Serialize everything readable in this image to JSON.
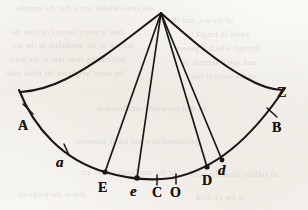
{
  "figure": {
    "kind": "geometric-line-diagram",
    "width": 308,
    "height": 210,
    "ink_color": "#1a1714",
    "paper_color": "#f7f5f1"
  },
  "geometry": {
    "apex": {
      "x": 161,
      "y": 13
    },
    "main_arc": {
      "label": "main-arc",
      "left_end": {
        "x": 19,
        "y": 90
      },
      "right_end": {
        "x": 285,
        "y": 88
      },
      "lowest": {
        "x": 150,
        "y": 180
      }
    },
    "upper_curve_left": {
      "label": "upper-curve-left-branch",
      "from": {
        "x": 161,
        "y": 13
      },
      "to": {
        "x": 21,
        "y": 92
      }
    },
    "upper_curve_right": {
      "label": "upper-curve-right-branch",
      "from": {
        "x": 161,
        "y": 13
      },
      "to": {
        "x": 283,
        "y": 90
      }
    },
    "chords": [
      {
        "name": "chord-apex-to-E",
        "from": {
          "x": 161,
          "y": 13
        },
        "to": {
          "x": 105,
          "y": 172
        }
      },
      {
        "name": "chord-apex-to-e",
        "from": {
          "x": 161,
          "y": 13
        },
        "to": {
          "x": 137,
          "y": 178
        }
      },
      {
        "name": "chord-apex-to-D",
        "from": {
          "x": 161,
          "y": 13
        },
        "to": {
          "x": 207,
          "y": 167
        }
      },
      {
        "name": "chord-apex-to-d",
        "from": {
          "x": 161,
          "y": 13
        },
        "to": {
          "x": 222,
          "y": 160
        }
      }
    ]
  },
  "points": [
    {
      "id": "A",
      "label": "A",
      "style": "capital",
      "marker": "tick",
      "marker_x": 28,
      "marker_y": 110,
      "label_x": 18,
      "label_y": 119
    },
    {
      "id": "a",
      "label": "a",
      "style": "italic",
      "marker": "tick",
      "marker_x": 66,
      "marker_y": 150,
      "label_x": 56,
      "label_y": 155
    },
    {
      "id": "E",
      "label": "E",
      "style": "capital",
      "marker": "node",
      "marker_x": 105,
      "marker_y": 172,
      "label_x": 98,
      "label_y": 181
    },
    {
      "id": "e",
      "label": "e",
      "style": "italic",
      "marker": "node",
      "marker_x": 137,
      "marker_y": 178,
      "label_x": 130,
      "label_y": 184
    },
    {
      "id": "C",
      "label": "C",
      "style": "capital",
      "marker": "tick",
      "marker_x": 157,
      "marker_y": 180,
      "label_x": 152,
      "label_y": 186
    },
    {
      "id": "O",
      "label": "O",
      "style": "capital",
      "marker": "tick",
      "marker_x": 176,
      "marker_y": 179,
      "label_x": 170,
      "label_y": 186
    },
    {
      "id": "D",
      "label": "D",
      "style": "capital",
      "marker": "node",
      "marker_x": 207,
      "marker_y": 167,
      "label_x": 202,
      "label_y": 174
    },
    {
      "id": "d",
      "label": "d",
      "style": "italic",
      "marker": "node",
      "marker_x": 222,
      "marker_y": 160,
      "label_x": 218,
      "label_y": 163
    },
    {
      "id": "B",
      "label": "B",
      "style": "capital",
      "marker": "tick",
      "marker_x": 272,
      "marker_y": 113,
      "label_x": 272,
      "label_y": 121
    },
    {
      "id": "Z",
      "label": "Z",
      "style": "capital",
      "marker": "none",
      "marker_x": 283,
      "marker_y": 90,
      "label_x": 277,
      "label_y": 86
    }
  ],
  "bleed_text": {
    "note": "faint mirrored show-through text from the reverse page",
    "lines": [
      {
        "text": "the considerable force that the impulse",
        "x": 14,
        "y": 4,
        "size": 8
      },
      {
        "text": "of the arc, and the time",
        "x": 150,
        "y": 16,
        "size": 8
      },
      {
        "text": "that in every second of time the",
        "x": 10,
        "y": 28,
        "size": 8
      },
      {
        "text": "equal in length to",
        "x": 186,
        "y": 30,
        "size": 8
      },
      {
        "text": "motion of the pendulum in the arc",
        "x": 12,
        "y": 41,
        "size": 8
      },
      {
        "text": "through which it passes",
        "x": 176,
        "y": 44,
        "size": 8
      },
      {
        "text": "descending from rest at the point",
        "x": 8,
        "y": 55,
        "size": 8
      },
      {
        "text": "and again ascends to",
        "x": 182,
        "y": 58,
        "size": 8
      },
      {
        "text": "the same height on the other side",
        "x": 6,
        "y": 69,
        "size": 8
      },
      {
        "text": "of the vertical line",
        "x": 190,
        "y": 72,
        "size": 8
      },
      {
        "text": "so that the whole oscillation is",
        "x": 96,
        "y": 104,
        "size": 8
      },
      {
        "text": "performed in equal times whatever",
        "x": 74,
        "y": 137,
        "size": 8
      },
      {
        "text": "be the amplitude of the arc",
        "x": 80,
        "y": 168,
        "size": 8
      },
      {
        "text": "as Galileo first observed",
        "x": 190,
        "y": 170,
        "size": 8
      },
      {
        "text": "this is the property",
        "x": 18,
        "y": 190,
        "size": 8
      },
      {
        "text": "of the cycloid",
        "x": 196,
        "y": 193,
        "size": 8
      }
    ]
  }
}
